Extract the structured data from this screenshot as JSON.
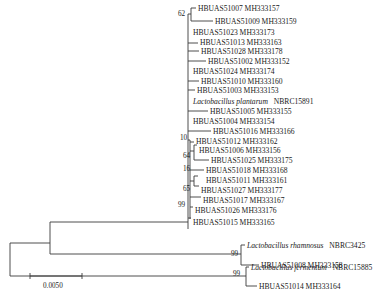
{
  "figure": {
    "type": "phylogenetic-tree",
    "scale_bar": {
      "label": "0.0050"
    },
    "taxa": [
      {
        "id": "t0",
        "name": "HBUAS51007 MH333157",
        "italic": false
      },
      {
        "id": "t1",
        "name": "HBUAS51009 MH333159",
        "italic": false
      },
      {
        "id": "t2",
        "name": "HBUAS51023 MH333173",
        "italic": false
      },
      {
        "id": "t3",
        "name": "HBUAS51013 MH333163",
        "italic": false
      },
      {
        "id": "t4",
        "name": "HBUAS51028 MH333178",
        "italic": false
      },
      {
        "id": "t5",
        "name": "HBUAS51002 MH333152",
        "italic": false
      },
      {
        "id": "t6",
        "name": "HBUAS51024 MH333174",
        "italic": false
      },
      {
        "id": "t7",
        "name": "HBUAS51010 MH333160",
        "italic": false
      },
      {
        "id": "t8",
        "name": "HBUAS51003 MH333153",
        "italic": false
      },
      {
        "id": "t9",
        "species": "Lactobacillus plantarum",
        "strain": "NBRC15891",
        "italic": true
      },
      {
        "id": "t10",
        "name": "HBUAS51005 MH333155",
        "italic": false
      },
      {
        "id": "t11",
        "name": "HBUAS51004 MH333154",
        "italic": false
      },
      {
        "id": "t12",
        "name": "HBUAS51016 MH333166",
        "italic": false
      },
      {
        "id": "t13",
        "name": "HBUAS51012 MH333162",
        "italic": false
      },
      {
        "id": "t14",
        "name": "HBUAS51006 MH333156",
        "italic": false
      },
      {
        "id": "t15",
        "name": "HBUAS51025 MH333175",
        "italic": false
      },
      {
        "id": "t16",
        "name": "HBUAS51018 MH333168",
        "italic": false
      },
      {
        "id": "t17",
        "name": "HBUAS51011 MH333161",
        "italic": false
      },
      {
        "id": "t18",
        "name": "HBUAS51027 MH333177",
        "italic": false
      },
      {
        "id": "t19",
        "name": "HBUAS51017 MH333167",
        "italic": false
      },
      {
        "id": "t20",
        "name": "HBUAS51026 MH333176",
        "italic": false
      },
      {
        "id": "t21",
        "name": "HBUAS51015 MH333165",
        "italic": false
      },
      {
        "id": "t22",
        "species": "Lactobacillus rhamnosus",
        "strain": "NBRC3425",
        "italic": true
      },
      {
        "id": "t23",
        "name": "HBUAS51008 MH333158",
        "italic": false
      },
      {
        "id": "t24",
        "species": "Lactobacillus fermentum",
        "strain": "NBRC15885",
        "italic": true
      },
      {
        "id": "t25",
        "name": "HBUAS51014 MH333164",
        "italic": false
      }
    ],
    "bootstrap": [
      {
        "id": "b62",
        "value": "62"
      },
      {
        "id": "b10",
        "value": "10"
      },
      {
        "id": "b64",
        "value": "64"
      },
      {
        "id": "b16",
        "value": "16"
      },
      {
        "id": "b65",
        "value": "65"
      },
      {
        "id": "b99a",
        "value": "99"
      },
      {
        "id": "b99b",
        "value": "99"
      },
      {
        "id": "b99c",
        "value": "99"
      }
    ]
  }
}
